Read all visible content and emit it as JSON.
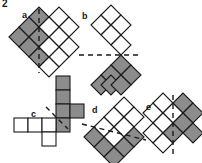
{
  "problem": {
    "number": "2"
  },
  "colors": {
    "shaded": "#8c8c8c",
    "unshaded": "#ffffff",
    "stroke": "#1a1a1a",
    "dash": "#1a1a1a",
    "background": "#ffffff"
  },
  "figures": [
    {
      "id": "a",
      "label": "a",
      "label_x": 22,
      "label_y": 13,
      "orientation": "diamond",
      "symmetry_axis": "vertical",
      "cells": [
        {
          "col": 0,
          "row": 1,
          "fill": "shaded"
        },
        {
          "col": 0,
          "row": 2,
          "fill": "shaded"
        },
        {
          "col": 1,
          "row": 0,
          "fill": "shaded"
        },
        {
          "col": 1,
          "row": 1,
          "fill": "shaded"
        },
        {
          "col": 1,
          "row": 2,
          "fill": "shaded"
        },
        {
          "col": 2,
          "row": 0,
          "fill": "unshaded"
        },
        {
          "col": 2,
          "row": 1,
          "fill": "unshaded"
        },
        {
          "col": 2,
          "row": 2,
          "fill": "unshaded"
        },
        {
          "col": 3,
          "row": 0,
          "fill": "unshaded"
        },
        {
          "col": 3,
          "row": 1,
          "fill": "unshaded"
        },
        {
          "col": 3,
          "row": 2,
          "fill": "unshaded"
        }
      ]
    },
    {
      "id": "b",
      "label": "b",
      "label_x": 82,
      "label_y": 14,
      "orientation": "diamond",
      "symmetry_axis": "horizontal",
      "cells": [
        {
          "col": 0,
          "row": 0,
          "fill": "unshaded"
        },
        {
          "col": 1,
          "row": 0,
          "fill": "unshaded"
        },
        {
          "col": 1,
          "row": 1,
          "fill": "unshaded"
        },
        {
          "col": 2,
          "row": 1,
          "fill": "unshaded"
        },
        {
          "col": 2,
          "row": 2,
          "fill": "shaded"
        },
        {
          "col": 2,
          "row": 3,
          "fill": "shaded"
        },
        {
          "col": 1,
          "row": 3,
          "fill": "shaded"
        },
        {
          "col": 3,
          "row": 2,
          "fill": "shaded"
        }
      ]
    },
    {
      "id": "c",
      "label": "c",
      "label_x": 31,
      "label_y": 113,
      "orientation": "square",
      "symmetry_axis": "diagonal",
      "cells": [
        {
          "col": 3,
          "row": 0,
          "fill": "shaded"
        },
        {
          "col": 3,
          "row": 1,
          "fill": "shaded"
        },
        {
          "col": 3,
          "row": 2,
          "fill": "shaded"
        },
        {
          "col": 4,
          "row": 2,
          "fill": "shaded"
        },
        {
          "col": 3,
          "row": 3,
          "fill": "shaded"
        },
        {
          "col": 0,
          "row": 3,
          "fill": "unshaded"
        },
        {
          "col": 1,
          "row": 3,
          "fill": "unshaded"
        },
        {
          "col": 2,
          "row": 3,
          "fill": "unshaded"
        },
        {
          "col": 2,
          "row": 4,
          "fill": "unshaded"
        }
      ]
    },
    {
      "id": "d",
      "label": "d",
      "label_x": 92,
      "label_y": 109,
      "orientation": "diamond",
      "symmetry_axis": "diagonal",
      "cells": [
        {
          "col": 1,
          "row": 0,
          "fill": "unshaded"
        },
        {
          "col": 2,
          "row": 0,
          "fill": "unshaded"
        },
        {
          "col": 1,
          "row": 1,
          "fill": "unshaded"
        },
        {
          "col": 2,
          "row": 1,
          "fill": "unshaded"
        },
        {
          "col": 0,
          "row": 1,
          "fill": "unshaded"
        },
        {
          "col": 0,
          "row": 2,
          "fill": "shaded"
        },
        {
          "col": 1,
          "row": 2,
          "fill": "unshaded"
        },
        {
          "col": 2,
          "row": 2,
          "fill": "shaded"
        },
        {
          "col": 1,
          "row": 3,
          "fill": "shaded"
        },
        {
          "col": 2,
          "row": 3,
          "fill": "shaded"
        },
        {
          "col": 0,
          "row": 3,
          "fill": "shaded"
        }
      ]
    },
    {
      "id": "e",
      "label": "e",
      "label_x": 146,
      "label_y": 106,
      "orientation": "diamond",
      "symmetry_axis": "vertical",
      "cells": [
        {
          "col": 0,
          "row": 0,
          "fill": "unshaded"
        },
        {
          "col": 0,
          "row": 1,
          "fill": "unshaded"
        },
        {
          "col": 0,
          "row": 2,
          "fill": "unshaded"
        },
        {
          "col": 1,
          "row": 0,
          "fill": "unshaded"
        },
        {
          "col": 1,
          "row": 1,
          "fill": "unshaded"
        },
        {
          "col": 1,
          "row": 2,
          "fill": "unshaded"
        },
        {
          "col": 2,
          "row": 0,
          "fill": "shaded"
        },
        {
          "col": 2,
          "row": 1,
          "fill": "shaded"
        },
        {
          "col": 2,
          "row": 2,
          "fill": "shaded"
        },
        {
          "col": 3,
          "row": 0,
          "fill": "shaded"
        },
        {
          "col": 3,
          "row": 1,
          "fill": "shaded"
        }
      ]
    }
  ]
}
